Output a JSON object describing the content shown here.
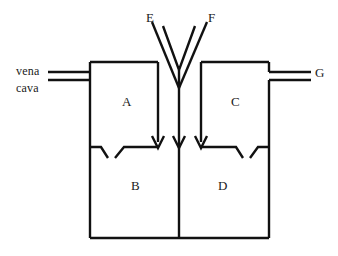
{
  "figure": {
    "background_color": "#ffffff",
    "stroke_color": "#111111",
    "label_color": "#1a1a1a"
  },
  "labels": {
    "chamber_a": "A",
    "chamber_b": "B",
    "chamber_c": "C",
    "chamber_d": "D",
    "vessel_e": "E",
    "vessel_f": "F",
    "vessel_g": "G",
    "vena": "vena",
    "cava": "cava"
  },
  "structures": [
    {
      "id": "chamber-a",
      "label": "A",
      "kind": "upper-left-chamber"
    },
    {
      "id": "chamber-b",
      "label": "B",
      "kind": "lower-left-chamber"
    },
    {
      "id": "chamber-c",
      "label": "C",
      "kind": "upper-right-chamber"
    },
    {
      "id": "chamber-d",
      "label": "D",
      "kind": "lower-right-chamber"
    },
    {
      "id": "vessel-e",
      "label": "E",
      "kind": "upper-left-vessel"
    },
    {
      "id": "vessel-f",
      "label": "F",
      "kind": "upper-right-vessel"
    },
    {
      "id": "vessel-g",
      "label": "G",
      "kind": "right-outflow-vessel"
    },
    {
      "id": "vena-cava",
      "label": "vena cava",
      "kind": "left-inflow-vessel"
    }
  ]
}
